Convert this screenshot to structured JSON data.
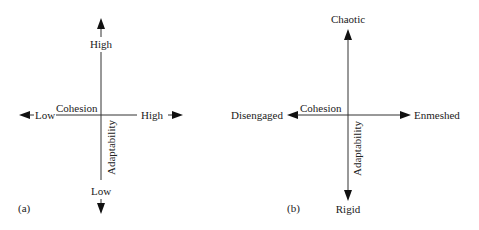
{
  "panels": [
    {
      "id": "a",
      "caption": "(a)",
      "horizontal_axis": {
        "name": "Cohesion",
        "left_label": "Low",
        "right_label": "High"
      },
      "vertical_axis": {
        "name": "Adaptability",
        "top_label": "High",
        "bottom_label": "Low"
      }
    },
    {
      "id": "b",
      "caption": "(b)",
      "horizontal_axis": {
        "name": "Cohesion",
        "left_label": "Disengaged",
        "right_label": "Enmeshed"
      },
      "vertical_axis": {
        "name": "Adaptability",
        "top_label": "Chaotic",
        "bottom_label": "Rigid"
      }
    }
  ],
  "colors": {
    "line": "#333333",
    "text": "#222222",
    "background": "#ffffff"
  }
}
